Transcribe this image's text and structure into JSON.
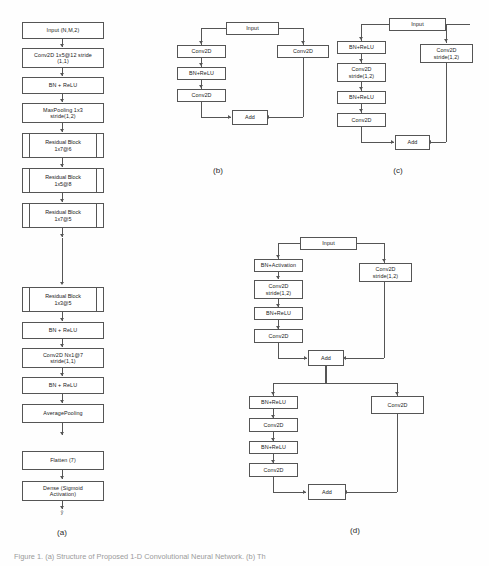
{
  "figure": {
    "caption": "Figure 1. (a) Structure of Proposed 1-D Convolutional Neural Network. (b) Th",
    "background": "#fefefe",
    "line_color": "#555555"
  },
  "panel_a": {
    "label": "(a)",
    "output_label": "ŷ",
    "nodes": [
      {
        "id": "a1",
        "type": "box",
        "text": "Input (N,M,2)"
      },
      {
        "id": "a2",
        "type": "box",
        "text": "Conv2D 1x5@12 stride\n(1,1)"
      },
      {
        "id": "a3",
        "type": "box",
        "text": "BN + ReLU"
      },
      {
        "id": "a4",
        "type": "box",
        "text": "MaxPooling 1x3\nstride(1,2)"
      },
      {
        "id": "a5",
        "type": "resblock",
        "text": "Residual Block\n1x7@6"
      },
      {
        "id": "a6",
        "type": "resblock",
        "text": "Residual Block\n1x5@8"
      },
      {
        "id": "a7",
        "type": "resblock",
        "text": "Residual Block\n1x7@5"
      },
      {
        "id": "a8",
        "type": "resblock",
        "text": "Residual Block\n1x3@5"
      },
      {
        "id": "a9",
        "type": "box",
        "text": "BN + ReLU"
      },
      {
        "id": "a10",
        "type": "box",
        "text": "Conv2D Nx1@7\nstride(1,1)"
      },
      {
        "id": "a11",
        "type": "box",
        "text": "BN + ReLU"
      },
      {
        "id": "a12",
        "type": "box",
        "text": "AveragePooling"
      },
      {
        "id": "a13",
        "type": "box",
        "text": "Flatten (7)"
      },
      {
        "id": "a14",
        "type": "box",
        "text": "Dense (Sigmoid\nActivation)"
      }
    ]
  },
  "panel_b": {
    "label": "(b)",
    "nodes": [
      {
        "id": "b_input",
        "text": "Input"
      },
      {
        "id": "b_conv1",
        "text": "Conv2D"
      },
      {
        "id": "b_bn",
        "text": "BN+ReLU"
      },
      {
        "id": "b_conv2",
        "text": "Conv2D"
      },
      {
        "id": "b_skip",
        "text": "Conv2D"
      },
      {
        "id": "b_add",
        "text": "Add"
      }
    ]
  },
  "panel_c": {
    "label": "(c)",
    "nodes": [
      {
        "id": "c_input",
        "text": "Input"
      },
      {
        "id": "c_bn1",
        "text": "BN+ReLU"
      },
      {
        "id": "c_conv1",
        "text": "Conv2D\nstride(1,2)"
      },
      {
        "id": "c_bn2",
        "text": "BN+ReLU"
      },
      {
        "id": "c_conv2",
        "text": "Conv2D"
      },
      {
        "id": "c_skip",
        "text": "Conv2D\nstride(1,2)"
      },
      {
        "id": "c_add",
        "text": "Add"
      }
    ]
  },
  "panel_d": {
    "label": "(d)",
    "nodes": [
      {
        "id": "d_input",
        "text": "Input"
      },
      {
        "id": "d_bn1",
        "text": "BN+Activation"
      },
      {
        "id": "d_conv1",
        "text": "Conv2D\nstride(1,2)"
      },
      {
        "id": "d_bn2",
        "text": "BN+ReLU"
      },
      {
        "id": "d_conv2",
        "text": "Conv2D"
      },
      {
        "id": "d_skip1",
        "text": "Conv2D\nstride(1,2)"
      },
      {
        "id": "d_add1",
        "text": "Add"
      },
      {
        "id": "d_bn3",
        "text": "BN+ReLU"
      },
      {
        "id": "d_conv3",
        "text": "Conv2D"
      },
      {
        "id": "d_bn4",
        "text": "BN+ReLU"
      },
      {
        "id": "d_conv4",
        "text": "Conv2D"
      },
      {
        "id": "d_skip2",
        "text": "Conv2D"
      },
      {
        "id": "d_add2",
        "text": "Add"
      }
    ]
  }
}
